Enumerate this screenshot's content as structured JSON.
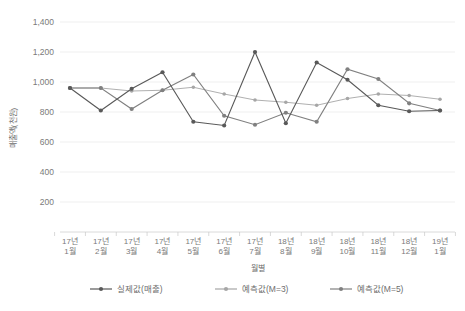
{
  "chart_data": {
    "type": "line",
    "title": "",
    "xlabel": "월별",
    "ylabel": "매출액(천원)",
    "ylim": [
      0,
      1400
    ],
    "ytick_step": 200,
    "grid": true,
    "legend_position": "bottom",
    "categories": [
      "17년\n1월",
      "17년\n2월",
      "17년\n3월",
      "17년\n4월",
      "17년\n5월",
      "17년\n6월",
      "17년\n7월",
      "18년\n8월",
      "18년\n9월",
      "18년\n10월",
      "18년\n11월",
      "18년\n12월",
      "19년\n1월"
    ],
    "categories_line1": [
      "17년",
      "17년",
      "17년",
      "17년",
      "17년",
      "17년",
      "17년",
      "18년",
      "18년",
      "18년",
      "18년",
      "18년",
      "19년"
    ],
    "categories_line2": [
      "1월",
      "2월",
      "3월",
      "4월",
      "5월",
      "6월",
      "7월",
      "8월",
      "9월",
      "10월",
      "11월",
      "12월",
      "1월"
    ],
    "ytick_labels": [
      "200",
      "400",
      "600",
      "800",
      "1,000",
      "1,200",
      "1,400"
    ],
    "ytick_values": [
      200,
      400,
      600,
      800,
      1000,
      1200,
      1400
    ],
    "series": [
      {
        "name": "실제값(매출)",
        "color": "#595959",
        "values": [
          960,
          810,
          955,
          1065,
          735,
          710,
          1200,
          725,
          1130,
          1015,
          845,
          805,
          810
        ]
      },
      {
        "name": "예측값(M=3)",
        "color": "#a6a6a6",
        "values": [
          960,
          960,
          940,
          945,
          965,
          920,
          880,
          865,
          845,
          890,
          920,
          910,
          885
        ]
      },
      {
        "name": "예측값(M=5)",
        "color": "#808080",
        "values": [
          960,
          960,
          820,
          945,
          1050,
          775,
          715,
          795,
          735,
          1085,
          1020,
          858,
          810
        ]
      }
    ]
  },
  "legend": {
    "items": [
      {
        "label": "실제값(매출)",
        "color": "#595959"
      },
      {
        "label": "예측값(M=3)",
        "color": "#a6a6a6"
      },
      {
        "label": "예측값(M=5)",
        "color": "#808080"
      }
    ]
  },
  "axes": {
    "x_title": "월별",
    "y_title": "매출액(천원)"
  }
}
